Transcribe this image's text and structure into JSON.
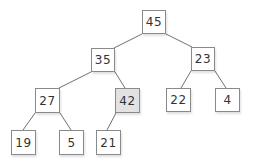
{
  "diagram": {
    "type": "binary-tree",
    "colors": {
      "border": "#8a8a8a",
      "edge": "#6f6f6f",
      "node_fill": "#ffffff",
      "highlight_fill": "#e2e2e2",
      "text": "#333333"
    },
    "nodes": [
      {
        "id": "n45",
        "label": "45",
        "x": 142,
        "y": 10,
        "w": 24,
        "h": 24,
        "highlight": false
      },
      {
        "id": "n35",
        "label": "35",
        "x": 91,
        "y": 48,
        "w": 24,
        "h": 24,
        "highlight": false
      },
      {
        "id": "n23",
        "label": "23",
        "x": 191,
        "y": 47,
        "w": 24,
        "h": 24,
        "highlight": false
      },
      {
        "id": "n27",
        "label": "27",
        "x": 35,
        "y": 88,
        "w": 25,
        "h": 25,
        "highlight": false
      },
      {
        "id": "n42",
        "label": "42",
        "x": 115,
        "y": 88,
        "w": 25,
        "h": 25,
        "highlight": true
      },
      {
        "id": "n22",
        "label": "22",
        "x": 166,
        "y": 88,
        "w": 25,
        "h": 24,
        "highlight": false
      },
      {
        "id": "n4",
        "label": "4",
        "x": 215,
        "y": 88,
        "w": 25,
        "h": 24,
        "highlight": false
      },
      {
        "id": "n19",
        "label": "19",
        "x": 11,
        "y": 130,
        "w": 25,
        "h": 25,
        "highlight": false
      },
      {
        "id": "n5",
        "label": "5",
        "x": 59,
        "y": 130,
        "w": 25,
        "h": 25,
        "highlight": false
      },
      {
        "id": "n21",
        "label": "21",
        "x": 96,
        "y": 130,
        "w": 25,
        "h": 25,
        "highlight": false
      }
    ],
    "edges": [
      {
        "from": "45",
        "to": "35",
        "x1": 142,
        "y1": 34,
        "x2": 114,
        "y2": 48
      },
      {
        "from": "45",
        "to": "23",
        "x1": 166,
        "y1": 34,
        "x2": 192,
        "y2": 47
      },
      {
        "from": "35",
        "to": "27",
        "x1": 91,
        "y1": 72,
        "x2": 59,
        "y2": 88
      },
      {
        "from": "35",
        "to": "42",
        "x1": 115,
        "y1": 72,
        "x2": 125,
        "y2": 88
      },
      {
        "from": "23",
        "to": "22",
        "x1": 191,
        "y1": 71,
        "x2": 181,
        "y2": 88
      },
      {
        "from": "23",
        "to": "4",
        "x1": 215,
        "y1": 71,
        "x2": 226,
        "y2": 88
      },
      {
        "from": "27",
        "to": "19",
        "x1": 35,
        "y1": 113,
        "x2": 23,
        "y2": 130
      },
      {
        "from": "27",
        "to": "5",
        "x1": 60,
        "y1": 113,
        "x2": 71,
        "y2": 130
      },
      {
        "from": "42",
        "to": "21",
        "x1": 116,
        "y1": 113,
        "x2": 107,
        "y2": 130
      }
    ]
  }
}
